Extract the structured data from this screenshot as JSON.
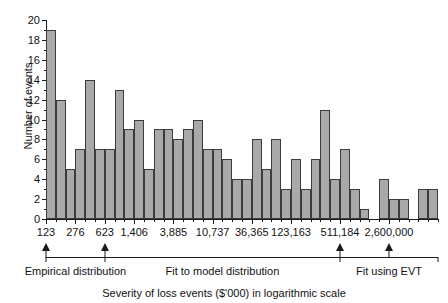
{
  "chart_data": {
    "type": "bar",
    "title": "",
    "subtitle": "",
    "xlabel": "Severity of loss events ($'000) in logarithmic scale",
    "ylabel": "Number of events",
    "ylim": [
      0,
      20
    ],
    "ytick_step": 2,
    "ytick_labels": [
      "0",
      "2",
      "4",
      "6",
      "8",
      "10",
      "12",
      "14",
      "16",
      "18",
      "20"
    ],
    "grid": false,
    "legend": null,
    "x_axis_scale": "logarithmic",
    "xtick_labels": [
      "123",
      "276",
      "623",
      "1,406",
      "3,885",
      "10,737",
      "36,365",
      "123,163",
      "511,184",
      "2,600,000"
    ],
    "xtick_bar_index": [
      0,
      3,
      6,
      9,
      13,
      17,
      21,
      25,
      30,
      35
    ],
    "bar_count": 40,
    "values": [
      19,
      12,
      5,
      7,
      14,
      7,
      7,
      13,
      9,
      10,
      5,
      9,
      9,
      8,
      9,
      10,
      7,
      7,
      6,
      4,
      4,
      8,
      5,
      8,
      3,
      6,
      3,
      6,
      11,
      4,
      7,
      3,
      1,
      0,
      4,
      2,
      2,
      0,
      3,
      3
    ],
    "annotations": [
      {
        "label": "Empirical distribution",
        "from_bar": 0,
        "to_bar": 6
      },
      {
        "label": "Fit to model distribution",
        "from_bar": 6,
        "to_bar": 30
      },
      {
        "label": "Fit using EVT",
        "from_bar": 30,
        "to_bar": 40
      }
    ],
    "arrow_markers": [
      "123",
      "623",
      "511,184",
      "2,600,000"
    ],
    "colors": {
      "bar_fill": "#a9a9a9",
      "bar_edge": "#3c3c3c",
      "axis": "#1a1a1a",
      "text": "#111111",
      "background": "#ffffff"
    }
  }
}
